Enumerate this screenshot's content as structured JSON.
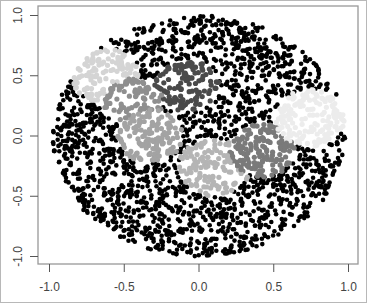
{
  "chart_data": {
    "type": "scatter",
    "title": "",
    "xlabel": "",
    "ylabel": "",
    "xlim": [
      -1.08,
      1.08
    ],
    "ylim": [
      -1.08,
      1.08
    ],
    "grid": false,
    "legend": null,
    "x_ticks": [
      "-1.0",
      "-0.5",
      "0.0",
      "0.5",
      "1.0"
    ],
    "y_ticks": [
      "-1.0",
      "-0.5",
      "0.0",
      "0.5",
      "1.0"
    ],
    "x_tick_values": [
      -1.0,
      -0.5,
      0.0,
      0.5,
      1.0
    ],
    "y_tick_values": [
      -1.0,
      -0.5,
      0.0,
      0.5,
      1.0
    ],
    "background_region": {
      "shape": "ellipse",
      "center": [
        0.0,
        0.0
      ],
      "radius_x": 0.98,
      "radius_y": 1.0,
      "color": "#000000",
      "label": "background points"
    },
    "series": [
      {
        "name": "cluster-1",
        "shape": "circle",
        "center": [
          -0.62,
          0.5
        ],
        "radius": 0.23,
        "color": "#d4d4d4"
      },
      {
        "name": "cluster-2",
        "shape": "circle",
        "center": [
          -0.08,
          0.42
        ],
        "radius": 0.22,
        "color": "#4a4a4a"
      },
      {
        "name": "cluster-3",
        "shape": "circle",
        "center": [
          -0.44,
          0.28
        ],
        "radius": 0.2,
        "color": "#8f8f8f"
      },
      {
        "name": "cluster-4",
        "shape": "circle",
        "center": [
          -0.33,
          0.0
        ],
        "radius": 0.22,
        "color": "#a3a3a3"
      },
      {
        "name": "cluster-5",
        "shape": "circle",
        "center": [
          0.1,
          -0.26
        ],
        "radius": 0.24,
        "color": "#b5b5b5"
      },
      {
        "name": "cluster-6",
        "shape": "circle",
        "center": [
          0.42,
          -0.12
        ],
        "radius": 0.22,
        "color": "#7a7a7a"
      },
      {
        "name": "cluster-7",
        "shape": "circle",
        "center": [
          0.75,
          0.15
        ],
        "radius": 0.24,
        "color": "#ececec"
      }
    ]
  },
  "axes": {
    "frame_color": "#999999",
    "tick_color": "#555555"
  }
}
